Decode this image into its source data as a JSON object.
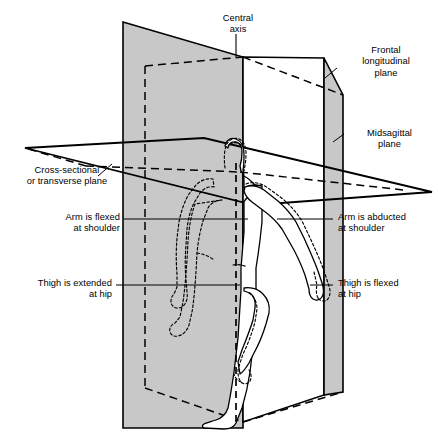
{
  "figure": {
    "background_color": "#ffffff",
    "stroke_color": "#000000",
    "plane_fill_gray": "#c8c8c8",
    "plane_fill_white": "#ffffff"
  },
  "labels": {
    "central_axis": "Central\naxis",
    "frontal_plane": "Frontal\nlongitudinal\nplane",
    "midsagittal_plane": "Midsagittal\nplane",
    "transverse_plane": "Cross-sectional\nor transverse plane",
    "arm_flexed": "Arm is flexed\nat shoulder",
    "arm_abducted": "Arm is abducted\nat shoulder",
    "thigh_extended": "Thigh is extended\nat hip",
    "thigh_flexed": "Thigh is flexed\nat hip"
  },
  "planes": [
    {
      "name": "frontal-longitudinal-plane",
      "label": "Frontal longitudinal plane",
      "fill": "#c8c8c8",
      "description": "Vertical coronal plane dividing body into front and back halves"
    },
    {
      "name": "midsagittal-plane",
      "label": "Midsagittal plane",
      "fill": "#c8c8c8",
      "description": "Vertical plane dividing body into left and right halves"
    },
    {
      "name": "transverse-plane",
      "label": "Cross-sectional or transverse plane",
      "fill": "none",
      "description": "Horizontal plane dividing body into upper and lower portions"
    }
  ],
  "annotations": [
    {
      "name": "central-axis",
      "text": "Central axis",
      "side": "top"
    },
    {
      "name": "arm-flexed",
      "text": "Arm is flexed at shoulder",
      "side": "left"
    },
    {
      "name": "arm-abducted",
      "text": "Arm is abducted at shoulder",
      "side": "right"
    },
    {
      "name": "thigh-extended",
      "text": "Thigh is extended at hip",
      "side": "left"
    },
    {
      "name": "thigh-flexed",
      "text": "Thigh is flexed at hip",
      "side": "right"
    }
  ]
}
